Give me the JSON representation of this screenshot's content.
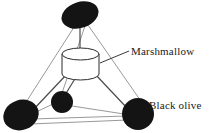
{
  "figure": {
    "background_color": "#ffffff",
    "ink_color": "#1a1a1a",
    "olive_color": "#141414",
    "stick_color": "#7a7a7a",
    "labels": {
      "marshmallow": "Marshmallow",
      "black_olive": "Black olive"
    },
    "parts": {
      "center_piece": {
        "name": "marshmallow",
        "shape": "cylinder",
        "center_x": 80.5,
        "top_y": 54,
        "bottom_y": 74,
        "rx": 18.5,
        "ry": 6
      },
      "olives": [
        {
          "name": "olive-top",
          "cx": 80,
          "cy": 15,
          "rx": 19,
          "ry": 13,
          "rotation": -18
        },
        {
          "name": "olive-bottom-left",
          "cx": 21,
          "cy": 115,
          "rx": 18,
          "ry": 15,
          "rotation": -20
        },
        {
          "name": "olive-bottom-middle",
          "cx": 62,
          "cy": 102,
          "rx": 11,
          "ry": 11,
          "rotation": 0
        },
        {
          "name": "olive-bottom-right",
          "cx": 138,
          "cy": 114,
          "rx": 16,
          "ry": 16,
          "rotation": 0
        }
      ],
      "toothpicks": [
        {
          "name": "stick-top",
          "x1": 80,
          "y1": 28,
          "x2": 80,
          "y2": 57
        },
        {
          "name": "stick-bottom-left",
          "x1": 66,
          "y1": 74,
          "x2": 33,
          "y2": 110
        },
        {
          "name": "stick-bottom-middle",
          "x1": 76,
          "y1": 77,
          "x2": 65,
          "y2": 95
        },
        {
          "name": "stick-bottom-right",
          "x1": 95,
          "y1": 74,
          "x2": 127,
          "y2": 108
        }
      ],
      "frame_edges": [
        {
          "name": "edge-apex-to-left",
          "x1": 76,
          "y1": 24,
          "x2": 14,
          "y2": 121
        },
        {
          "name": "edge-apex-to-right",
          "x1": 88,
          "y1": 25,
          "x2": 145,
          "y2": 107
        },
        {
          "name": "edge-apex-to-middle",
          "x1": 85,
          "y1": 26,
          "x2": 62,
          "y2": 93
        },
        {
          "name": "edge-left-to-right",
          "x1": 30,
          "y1": 124,
          "x2": 128,
          "y2": 120
        },
        {
          "name": "edge-left-to-middle",
          "x1": 34,
          "y1": 113,
          "x2": 53,
          "y2": 104
        },
        {
          "name": "edge-middle-to-right",
          "x1": 72,
          "y1": 106,
          "x2": 124,
          "y2": 114
        }
      ],
      "leader_line": {
        "name": "leader-marshmallow",
        "x1": 100,
        "y1": 63,
        "x2": 129,
        "y2": 51
      }
    }
  }
}
